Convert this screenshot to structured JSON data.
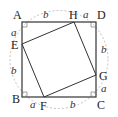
{
  "diagram": {
    "colors": {
      "line": "#333333",
      "dashed": "#aaaaaa",
      "text": "#222222"
    },
    "points": {
      "A": {
        "label": "A",
        "x": 22,
        "y": 22
      },
      "D": {
        "label": "D",
        "x": 96,
        "y": 22
      },
      "B": {
        "label": "B",
        "x": 22,
        "y": 97
      },
      "C": {
        "label": "C",
        "x": 96,
        "y": 97
      },
      "H": {
        "label": "H",
        "x": 74,
        "y": 22
      },
      "E": {
        "label": "E",
        "x": 22,
        "y": 44
      },
      "F": {
        "label": "F",
        "x": 44,
        "y": 97
      },
      "G": {
        "label": "G",
        "x": 96,
        "y": 75
      }
    },
    "segment_labels": {
      "AH": "b",
      "HD": "a",
      "AE": "a",
      "EB": "b",
      "BF": "a",
      "FC": "b",
      "DG": "b",
      "GC": "a"
    },
    "right_angle_marks": [
      "A",
      "D",
      "B",
      "C"
    ]
  }
}
